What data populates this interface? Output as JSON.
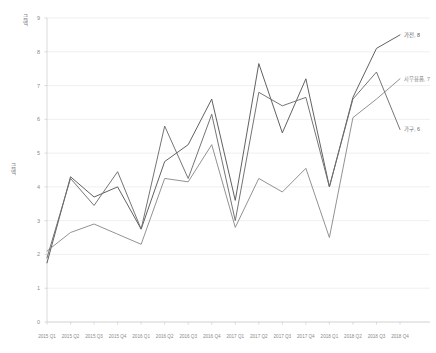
{
  "chart_data": {
    "type": "line",
    "title": "",
    "xlabel": "",
    "ylabel": "금액",
    "ylim": [
      0,
      9
    ],
    "grid": true,
    "legend_position": "end-of-line-labels",
    "categories": [
      "2015 Q1",
      "2015 Q2",
      "2015 Q3",
      "2015 Q4",
      "2016 Q1",
      "2016 Q2",
      "2016 Q3",
      "2016 Q4",
      "2017 Q1",
      "2017 Q2",
      "2017 Q3",
      "2017 Q4",
      "2018 Q1",
      "2018 Q2",
      "2018 Q3",
      "2018 Q4"
    ],
    "yticks": [
      "9",
      "8",
      "7",
      "6",
      "5",
      "4",
      "3",
      "2",
      "1",
      "0"
    ],
    "series": [
      {
        "name": "가전",
        "color": "#595959",
        "end_label": "가전, 8",
        "values": [
          1.75,
          4.3,
          3.7,
          4.0,
          2.75,
          4.75,
          5.25,
          6.6,
          3.6,
          7.65,
          5.6,
          7.2,
          4.0,
          6.65,
          8.1,
          8.5
        ]
      },
      {
        "name": "사무용품",
        "color": "#8c8c8c",
        "end_label": "사무용품, 7",
        "values": [
          2.1,
          2.65,
          2.9,
          2.6,
          2.3,
          4.25,
          4.15,
          5.25,
          2.8,
          4.25,
          3.85,
          4.55,
          2.5,
          6.05,
          6.6,
          7.2
        ]
      },
      {
        "name": "가구",
        "color": "#6e6e6e",
        "end_label": "가구, 6",
        "values": [
          1.9,
          4.25,
          3.45,
          4.45,
          2.75,
          5.8,
          4.25,
          6.15,
          3.0,
          6.8,
          6.4,
          6.65,
          4.0,
          6.6,
          7.4,
          5.7
        ]
      }
    ]
  },
  "y_axis_top_label": "금액"
}
